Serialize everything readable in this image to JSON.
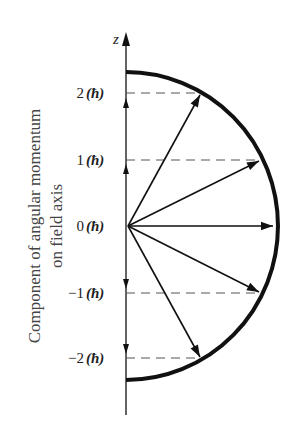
{
  "diagram": {
    "axis_label": "z",
    "side_label_line1": "Component of angular momentum",
    "side_label_line2": "on field axis",
    "levels": [
      {
        "m": 2,
        "label": "2",
        "unit": "(ħ)"
      },
      {
        "m": 1,
        "label": "1",
        "unit": "(ħ)"
      },
      {
        "m": 0,
        "label": "0",
        "unit": "(ħ)"
      },
      {
        "m": -1,
        "label": "−1",
        "unit": "(ħ)"
      },
      {
        "m": -2,
        "label": "−2",
        "unit": "(ħ)"
      }
    ],
    "colors": {
      "ink": "#111111",
      "dash": "#555555",
      "text": "#222222"
    }
  }
}
